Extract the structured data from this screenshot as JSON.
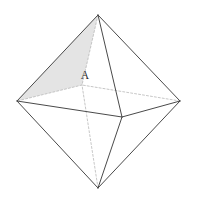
{
  "figure": {
    "name": "octahedron-diagram",
    "kind": "3d-solid-line-drawing",
    "solid": "octahedron",
    "background_color": "#ffffff",
    "canvas": {
      "width": 197,
      "height": 205
    },
    "style": {
      "visible_edge_color": "#4a4a4a",
      "hidden_edge_color": "#b9b9b9",
      "shaded_face_fill": "#e3e3e3",
      "shaded_face_opacity": 0.85,
      "unshaded_face_fill": "#ffffff",
      "visible_edge_width": 1.0,
      "hidden_edge_width": 0.8,
      "hidden_edge_dash": "2,2",
      "label_color": "#2b2b2b",
      "label_font_size": 11.5
    },
    "vertices": [
      {
        "id": "top",
        "role": "top-apex",
        "x": 98,
        "y": 15,
        "hidden": false
      },
      {
        "id": "left",
        "role": "left-equator",
        "x": 17,
        "y": 101,
        "hidden": false
      },
      {
        "id": "right",
        "role": "right-equator",
        "x": 180,
        "y": 101,
        "hidden": false
      },
      {
        "id": "front",
        "role": "front-equator",
        "x": 122,
        "y": 117,
        "hidden": false
      },
      {
        "id": "back",
        "role": "back-equator",
        "x": 82,
        "y": 85,
        "hidden": true
      },
      {
        "id": "bottom",
        "role": "bottom-apex",
        "x": 98,
        "y": 188,
        "hidden": false
      }
    ],
    "edges": [
      {
        "from": "top",
        "to": "left",
        "hidden": false
      },
      {
        "from": "top",
        "to": "right",
        "hidden": false
      },
      {
        "from": "top",
        "to": "front",
        "hidden": false
      },
      {
        "from": "top",
        "to": "back",
        "hidden": true
      },
      {
        "from": "bottom",
        "to": "left",
        "hidden": false
      },
      {
        "from": "bottom",
        "to": "right",
        "hidden": false
      },
      {
        "from": "bottom",
        "to": "front",
        "hidden": false
      },
      {
        "from": "bottom",
        "to": "back",
        "hidden": true
      },
      {
        "from": "left",
        "to": "front",
        "hidden": false
      },
      {
        "from": "front",
        "to": "right",
        "hidden": false
      },
      {
        "from": "right",
        "to": "back",
        "hidden": true
      },
      {
        "from": "back",
        "to": "left",
        "hidden": true
      }
    ],
    "faces": [
      {
        "id": "top-left-front",
        "vertices": [
          "top",
          "left",
          "front"
        ],
        "shaded": true,
        "visible": true
      },
      {
        "id": "top-left-back",
        "vertices": [
          "top",
          "left",
          "back"
        ],
        "shaded": true,
        "visible": false
      },
      {
        "id": "top-back-right",
        "vertices": [
          "top",
          "back",
          "right"
        ],
        "shaded": false,
        "visible": false
      },
      {
        "id": "top-front-right",
        "vertices": [
          "top",
          "front",
          "right"
        ],
        "shaded": false,
        "visible": true
      },
      {
        "id": "bot-left-front",
        "vertices": [
          "bottom",
          "left",
          "front"
        ],
        "shaded": false,
        "visible": true
      },
      {
        "id": "bot-front-right",
        "vertices": [
          "bottom",
          "front",
          "right"
        ],
        "shaded": false,
        "visible": true
      },
      {
        "id": "bot-right-back",
        "vertices": [
          "bottom",
          "right",
          "back"
        ],
        "shaded": false,
        "visible": false
      },
      {
        "id": "bot-back-left",
        "vertices": [
          "bottom",
          "back",
          "left"
        ],
        "shaded": false,
        "visible": false
      }
    ],
    "labels": [
      {
        "id": "label-a",
        "text": "A",
        "x": 85,
        "y": 79,
        "anchor": "middle"
      }
    ]
  }
}
